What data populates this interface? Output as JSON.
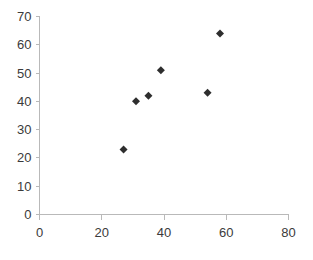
{
  "chart_data": {
    "type": "scatter",
    "title": "",
    "xlabel": "",
    "ylabel": "",
    "xlim": [
      0,
      80
    ],
    "ylim": [
      0,
      70
    ],
    "xticks": [
      0,
      20,
      40,
      60,
      80
    ],
    "yticks": [
      0,
      10,
      20,
      30,
      40,
      50,
      60,
      70
    ],
    "xtick_labels": [
      "0",
      "20",
      "40",
      "60",
      "80"
    ],
    "ytick_labels": [
      "0",
      "10",
      "20",
      "30",
      "40",
      "50",
      "60",
      "70"
    ],
    "grid": false,
    "legend": false,
    "marker": "diamond",
    "marker_color": "#2e2e2e",
    "marker_size": 7,
    "background_color": "#ffffff",
    "axis_color": "#b9b9b9",
    "series": [
      {
        "name": "Series 1",
        "points": [
          {
            "x": 27,
            "y": 23
          },
          {
            "x": 31,
            "y": 40
          },
          {
            "x": 35,
            "y": 42
          },
          {
            "x": 39,
            "y": 51
          },
          {
            "x": 54,
            "y": 43
          },
          {
            "x": 58,
            "y": 64
          }
        ]
      }
    ]
  },
  "axes": {
    "x_axis_name": "x-axis",
    "y_axis_name": "y-axis"
  }
}
